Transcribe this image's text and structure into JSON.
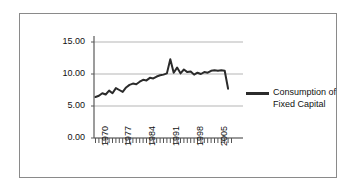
{
  "chart_data": {
    "type": "line",
    "title": "",
    "xlabel": "",
    "ylabel": "",
    "ylim": [
      0,
      15
    ],
    "xlim": [
      1970,
      2010
    ],
    "grid": true,
    "gridlines": [
      0.0,
      5.0,
      10.0,
      15.0
    ],
    "legend_position": "right",
    "ytick_labels": [
      "15.00",
      "10.00",
      "5.00",
      "0.00"
    ],
    "ytick_values": [
      15.0,
      10.0,
      5.0,
      0.0
    ],
    "xtick_labels": [
      "1970",
      "1977",
      "1984",
      "1991",
      "1998",
      "2005"
    ],
    "xtick_values": [
      1970,
      1977,
      1984,
      1991,
      1998,
      2005
    ],
    "series": [
      {
        "name": "Consumption of Fixed Capital",
        "color": "#2b2b2b",
        "x": [
          1970,
          1971,
          1972,
          1973,
          1974,
          1975,
          1976,
          1977,
          1978,
          1979,
          1980,
          1981,
          1982,
          1983,
          1984,
          1985,
          1986,
          1987,
          1988,
          1989,
          1990,
          1991,
          1992,
          1993,
          1994,
          1995,
          1996,
          1997,
          1998,
          1999,
          2000,
          2001,
          2002,
          2003,
          2004,
          2005,
          2006,
          2007,
          2008,
          2009
        ],
        "values": [
          6.4,
          6.6,
          7.0,
          6.8,
          7.4,
          7.0,
          7.8,
          7.5,
          7.2,
          7.9,
          8.3,
          8.5,
          8.4,
          8.8,
          9.1,
          9.0,
          9.4,
          9.3,
          9.6,
          9.8,
          9.9,
          10.1,
          12.3,
          10.2,
          11.0,
          10.1,
          10.7,
          10.3,
          10.4,
          9.9,
          10.2,
          10.0,
          10.3,
          10.2,
          10.5,
          10.6,
          10.5,
          10.6,
          10.5,
          7.7
        ]
      }
    ],
    "legend": [
      {
        "label_line1": "Consumption of",
        "label_line2": "Fixed Capital",
        "color": "#2b2b2b"
      }
    ]
  }
}
